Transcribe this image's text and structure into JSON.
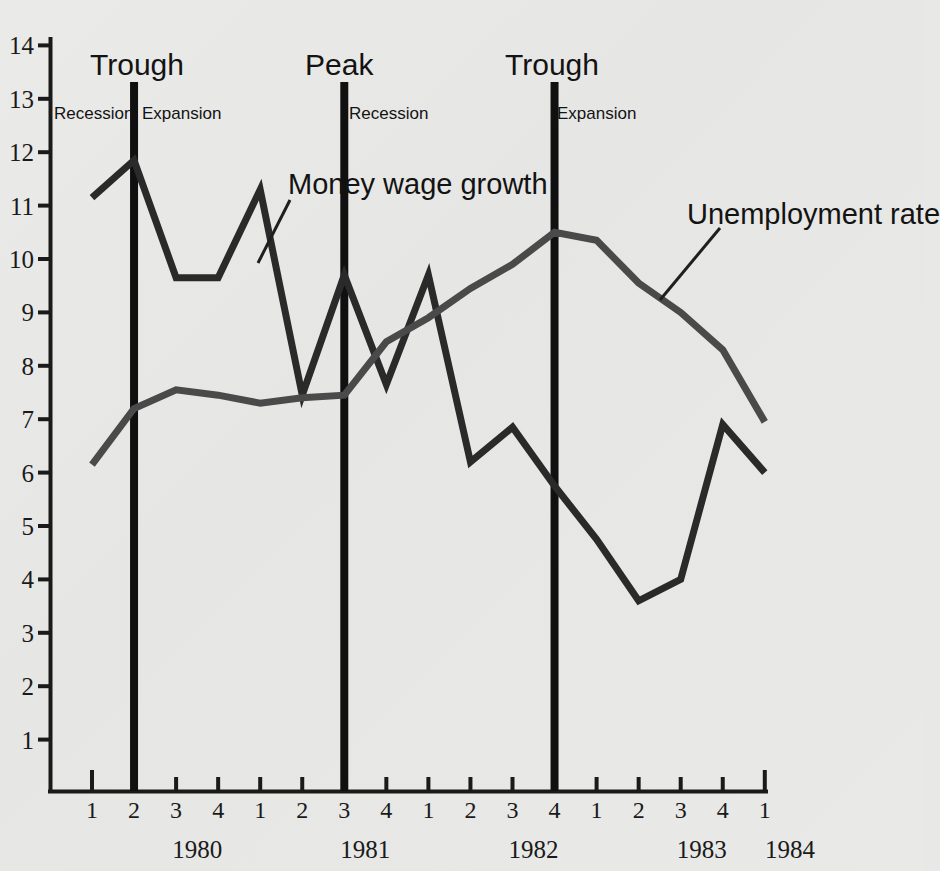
{
  "chart_data": {
    "type": "line",
    "title": "",
    "xlabel": "",
    "ylabel": "",
    "ylim": [
      0,
      14
    ],
    "yticks": [
      1,
      2,
      3,
      4,
      5,
      6,
      7,
      8,
      9,
      10,
      11,
      12,
      13,
      14
    ],
    "grid": false,
    "legend_position": "inline-annotations",
    "x": [
      "1980 Q1",
      "1980 Q2",
      "1980 Q3",
      "1980 Q4",
      "1981 Q1",
      "1981 Q2",
      "1981 Q3",
      "1981 Q4",
      "1982 Q1",
      "1982 Q2",
      "1982 Q3",
      "1982 Q4",
      "1983 Q1",
      "1983 Q2",
      "1983 Q3",
      "1983 Q4",
      "1984 Q1"
    ],
    "quarter_ticks": [
      "1",
      "2",
      "3",
      "4",
      "1",
      "2",
      "3",
      "4",
      "1",
      "2",
      "3",
      "4",
      "1",
      "2",
      "3",
      "4",
      "1"
    ],
    "years": [
      "1980",
      "1981",
      "1982",
      "1983",
      "1984"
    ],
    "series": [
      {
        "name": "Money wage growth",
        "color": "#2a2a2a",
        "values": [
          11.15,
          11.85,
          9.65,
          9.65,
          11.3,
          7.45,
          9.7,
          7.65,
          9.7,
          6.2,
          6.85,
          5.75,
          4.75,
          3.6,
          4.0,
          6.9,
          6.0
        ]
      },
      {
        "name": "Unemployment rate",
        "color": "#4a4a4a",
        "values": [
          6.15,
          7.2,
          7.55,
          7.45,
          7.3,
          7.4,
          7.45,
          8.45,
          8.9,
          9.45,
          9.9,
          10.5,
          10.35,
          9.55,
          9.0,
          8.3,
          6.95
        ]
      }
    ],
    "annotations": [
      {
        "id": "trough-1980q2",
        "label": "Trough",
        "at_x": "1980 Q2",
        "left_phase": "Recession",
        "right_phase": "Expansion"
      },
      {
        "id": "peak-1981q3",
        "label": "Peak",
        "at_x": "1981 Q3",
        "left_phase": "",
        "right_phase": "Recession"
      },
      {
        "id": "trough-1982q4",
        "label": "Trough",
        "at_x": "1982 Q4",
        "left_phase": "",
        "right_phase": "Expansion"
      }
    ],
    "series_callouts": [
      {
        "label": "Money wage growth",
        "points_to": "1980 Q4"
      },
      {
        "label": "Unemployment rate",
        "points_to": "1983 Q1"
      }
    ]
  },
  "axis": {
    "y_labels": [
      "14",
      "13",
      "12",
      "11",
      "10",
      "9",
      "8",
      "7",
      "6",
      "5",
      "4",
      "3",
      "2",
      "1"
    ],
    "quarter_labels": [
      "1",
      "2",
      "3",
      "4",
      "1",
      "2",
      "3",
      "4",
      "1",
      "2",
      "3",
      "4",
      "1",
      "2",
      "3",
      "4",
      "1"
    ],
    "year_labels": [
      "1980",
      "1981",
      "1982",
      "1983",
      "1984"
    ]
  },
  "annotations": {
    "trough_1": "Trough",
    "peak_1": "Peak",
    "trough_2": "Trough",
    "recession_1": "Recession",
    "expansion_1": "Expansion",
    "recession_2": "Recession",
    "expansion_2": "Expansion",
    "money_wage_growth": "Money wage growth",
    "unemployment_rate": "Unemployment rate"
  },
  "colors": {
    "money_wage": "#2a2a2a",
    "unemployment": "#4a4a4a",
    "axis": "#1a1a1a",
    "background": "#e8e8e6"
  }
}
